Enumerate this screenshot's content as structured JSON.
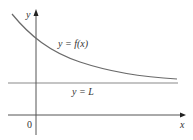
{
  "diagram": {
    "type": "function-graph",
    "axes": {
      "x_label": "x",
      "y_label": "y",
      "origin_label": "0"
    },
    "curve": {
      "label": "y = f(x)",
      "behavior": "decreasing, approaches L as x increases"
    },
    "asymptote": {
      "label": "y = L",
      "orientation": "horizontal"
    },
    "colors": {
      "axis": "#555555",
      "curve": "#6a6a6a",
      "asymptote": "#8a8a8a",
      "text": "#333333"
    }
  }
}
